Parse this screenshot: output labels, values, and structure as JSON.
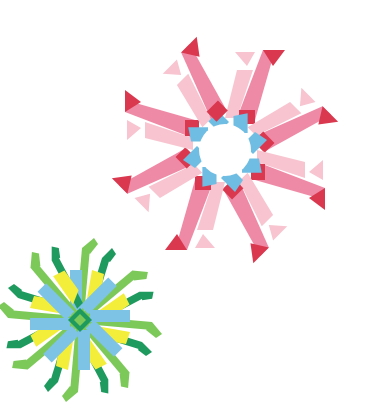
{
  "scene": {
    "description": "Two origami modular pinwheel stars on white background",
    "background": "#ffffff"
  },
  "stars": [
    {
      "name": "pink-pinwheel-star",
      "center": [
        225,
        150
      ],
      "arms": 8,
      "colors": {
        "light_pink": "#f7c4d0",
        "pink": "#ef8aa6",
        "mid_pink": "#f4a6ba",
        "red": "#d9384f",
        "blue": "#6fbde3"
      }
    },
    {
      "name": "green-pinwheel-star",
      "center": [
        80,
        320
      ],
      "arms": 8,
      "colors": {
        "dark_green": "#1f9a5f",
        "light_green": "#7cc95a",
        "yellow": "#f2ee3a",
        "blue": "#7cc3e6"
      }
    }
  ]
}
